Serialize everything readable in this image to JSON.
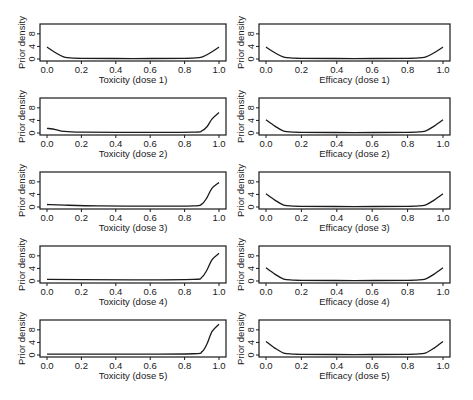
{
  "figure": {
    "ylabel": "Prior density",
    "x_ticks": [
      "0.0",
      "0.2",
      "0.4",
      "0.6",
      "0.8",
      "1.0"
    ],
    "y_ticks": [
      "0",
      "4",
      "8"
    ]
  },
  "chart_data": [
    {
      "type": "line",
      "title": "",
      "xlabel": "Toxicity (dose 1)",
      "ylabel": "Prior density",
      "xlim": [
        0,
        1
      ],
      "ylim": [
        0,
        10.5
      ],
      "grid": false,
      "x": [
        0,
        0.05,
        0.1,
        0.15,
        0.2,
        0.5,
        0.8,
        0.85,
        0.9,
        0.95,
        1.0
      ],
      "values": [
        3.8,
        2.0,
        0.6,
        0.3,
        0.2,
        0.15,
        0.2,
        0.3,
        0.6,
        2.0,
        3.8
      ]
    },
    {
      "type": "line",
      "title": "",
      "xlabel": "Efficacy (dose 1)",
      "ylabel": "Prior density",
      "xlim": [
        0,
        1
      ],
      "ylim": [
        0,
        10.5
      ],
      "grid": false,
      "x": [
        0,
        0.05,
        0.1,
        0.15,
        0.2,
        0.5,
        0.8,
        0.85,
        0.9,
        0.95,
        1.0
      ],
      "values": [
        3.8,
        2.0,
        0.6,
        0.3,
        0.2,
        0.15,
        0.2,
        0.3,
        0.6,
        2.0,
        3.8
      ]
    },
    {
      "type": "line",
      "title": "",
      "xlabel": "Toxicity (dose 2)",
      "ylabel": "Prior density",
      "xlim": [
        0,
        1
      ],
      "ylim": [
        0,
        10.5
      ],
      "grid": false,
      "x": [
        0,
        0.05,
        0.1,
        0.2,
        0.5,
        0.85,
        0.9,
        0.93,
        0.96,
        1.0
      ],
      "values": [
        1.5,
        1.1,
        0.5,
        0.25,
        0.2,
        0.3,
        0.7,
        2.0,
        4.5,
        6.5
      ]
    },
    {
      "type": "line",
      "title": "",
      "xlabel": "Efficacy (dose 2)",
      "ylabel": "Prior density",
      "xlim": [
        0,
        1
      ],
      "ylim": [
        0,
        10.5
      ],
      "grid": false,
      "x": [
        0,
        0.05,
        0.1,
        0.15,
        0.2,
        0.5,
        0.8,
        0.85,
        0.9,
        0.95,
        1.0
      ],
      "values": [
        4.2,
        2.2,
        0.6,
        0.3,
        0.2,
        0.15,
        0.2,
        0.3,
        0.6,
        2.2,
        4.2
      ]
    },
    {
      "type": "line",
      "title": "",
      "xlabel": "Toxicity (dose 3)",
      "ylabel": "Prior density",
      "xlim": [
        0,
        1
      ],
      "ylim": [
        0,
        10.5
      ],
      "grid": false,
      "x": [
        0,
        0.1,
        0.3,
        0.6,
        0.85,
        0.9,
        0.93,
        0.96,
        1.0
      ],
      "values": [
        0.8,
        0.6,
        0.35,
        0.25,
        0.35,
        0.9,
        3.0,
        6.0,
        7.8
      ]
    },
    {
      "type": "line",
      "title": "",
      "xlabel": "Efficacy (dose 3)",
      "ylabel": "Prior density",
      "xlim": [
        0,
        1
      ],
      "ylim": [
        0,
        10.5
      ],
      "grid": false,
      "x": [
        0,
        0.05,
        0.1,
        0.15,
        0.2,
        0.5,
        0.8,
        0.85,
        0.9,
        0.95,
        1.0
      ],
      "values": [
        4.2,
        2.2,
        0.6,
        0.3,
        0.2,
        0.15,
        0.2,
        0.3,
        0.6,
        2.2,
        4.2
      ]
    },
    {
      "type": "line",
      "title": "",
      "xlabel": "Toxicity (dose 4)",
      "ylabel": "Prior density",
      "xlim": [
        0,
        1
      ],
      "ylim": [
        0,
        10.5
      ],
      "grid": false,
      "x": [
        0,
        0.2,
        0.5,
        0.85,
        0.9,
        0.93,
        0.96,
        1.0
      ],
      "values": [
        0.5,
        0.45,
        0.35,
        0.5,
        1.2,
        3.5,
        6.8,
        8.8
      ]
    },
    {
      "type": "line",
      "title": "",
      "xlabel": "Efficacy (dose 4)",
      "ylabel": "Prior density",
      "xlim": [
        0,
        1
      ],
      "ylim": [
        0,
        10.5
      ],
      "grid": false,
      "x": [
        0,
        0.05,
        0.1,
        0.15,
        0.2,
        0.5,
        0.8,
        0.85,
        0.9,
        0.95,
        1.0
      ],
      "values": [
        4.2,
        2.2,
        0.6,
        0.3,
        0.2,
        0.15,
        0.2,
        0.3,
        0.6,
        2.2,
        4.2
      ]
    },
    {
      "type": "line",
      "title": "",
      "xlabel": "Toxicity (dose 5)",
      "ylabel": "Prior density",
      "xlim": [
        0,
        1
      ],
      "ylim": [
        0,
        10.5
      ],
      "grid": false,
      "x": [
        0,
        0.2,
        0.5,
        0.85,
        0.9,
        0.93,
        0.96,
        1.0
      ],
      "values": [
        0.3,
        0.3,
        0.25,
        0.4,
        1.0,
        3.5,
        7.5,
        9.8
      ]
    },
    {
      "type": "line",
      "title": "",
      "xlabel": "Efficacy (dose 5)",
      "ylabel": "Prior density",
      "xlim": [
        0,
        1
      ],
      "ylim": [
        0,
        10.5
      ],
      "grid": false,
      "x": [
        0,
        0.05,
        0.1,
        0.15,
        0.2,
        0.5,
        0.8,
        0.85,
        0.9,
        0.95,
        1.0
      ],
      "values": [
        4.3,
        2.2,
        0.6,
        0.3,
        0.2,
        0.15,
        0.2,
        0.3,
        0.6,
        2.2,
        4.3
      ]
    }
  ]
}
